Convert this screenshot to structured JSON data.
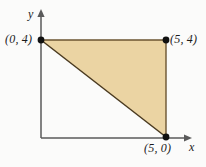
{
  "figure": {
    "type": "coordinate-plane-diagram",
    "background_color": "#fbfbfa",
    "axes": {
      "x_label": "x",
      "y_label": "y",
      "axis_color": "#5a5a5a",
      "origin_px": [
        41,
        138
      ],
      "x_axis_end_px": [
        192,
        138
      ],
      "y_axis_end_px": [
        41,
        12
      ]
    },
    "shape": {
      "name": "triangle",
      "fill_color": "#ebd4a3",
      "edge_color": "#6b5430",
      "vertices": [
        {
          "label": "(0, 4)",
          "x": 0,
          "y": 4,
          "px": [
            41,
            40
          ]
        },
        {
          "label": "(5, 4)",
          "x": 5,
          "y": 4,
          "px": [
            166,
            40
          ]
        },
        {
          "label": "(5, 0)",
          "x": 5,
          "y": 0,
          "px": [
            166,
            137
          ]
        }
      ],
      "vertex_dot_color": "#111111"
    },
    "labels": {
      "point_0_4": "(0, 4)",
      "point_5_4": "(5, 4)",
      "point_5_0": "(5, 0)",
      "axis_x": "x",
      "axis_y": "y"
    }
  }
}
